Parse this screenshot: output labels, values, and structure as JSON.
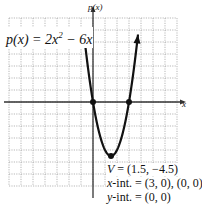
{
  "chart_data": {
    "type": "line",
    "title": "",
    "function_label": "p(x) = 2x^2 - 6x",
    "function_label_parts": {
      "prefix": "p(x) = 2x",
      "exponent": "2",
      "suffix": " − 6x"
    },
    "xlabel": "x",
    "ylabel": "p(x)",
    "xlim": [
      -7,
      7
    ],
    "ylim": [
      -7,
      7
    ],
    "grid": true,
    "grid_step": 1,
    "series": [
      {
        "name": "p(x) = 2x^2 - 6x",
        "expression": "2x^2 - 6x",
        "x": [
          -0.75,
          0,
          0.5,
          1,
          1.5,
          2,
          2.5,
          3,
          3.75
        ],
        "values": [
          5.625,
          0,
          -2.5,
          -4,
          -4.5,
          -4,
          -2.5,
          0,
          5.625
        ]
      }
    ],
    "points": [
      {
        "label": "x-intercept",
        "x": 0,
        "y": 0
      },
      {
        "label": "x-intercept",
        "x": 3,
        "y": 0
      },
      {
        "label": "vertex",
        "x": 1.5,
        "y": -4.5
      }
    ],
    "annotations": {
      "vertex": "V = (1.5, −4.5)",
      "x_int": "x-int. = (3, 0), (0, 0)",
      "y_int": "y-int. = (0, 0)"
    }
  },
  "labels": {
    "equation_prefix": "p(x) = 2x",
    "equation_exp": "2",
    "equation_suffix": " − 6x",
    "y_axis": "p(x)",
    "x_axis": "x",
    "vertex_var": "V",
    "vertex_val": " = (1.5, −4.5)",
    "xint_var": "x",
    "xint_val": "-int. = (3, 0), (0, 0)",
    "yint_var": "y",
    "yint_val": "-int. = (0, 0)"
  },
  "colors": {
    "curve": "#111111",
    "grid": "#9a9a9a",
    "axis": "#333333"
  }
}
